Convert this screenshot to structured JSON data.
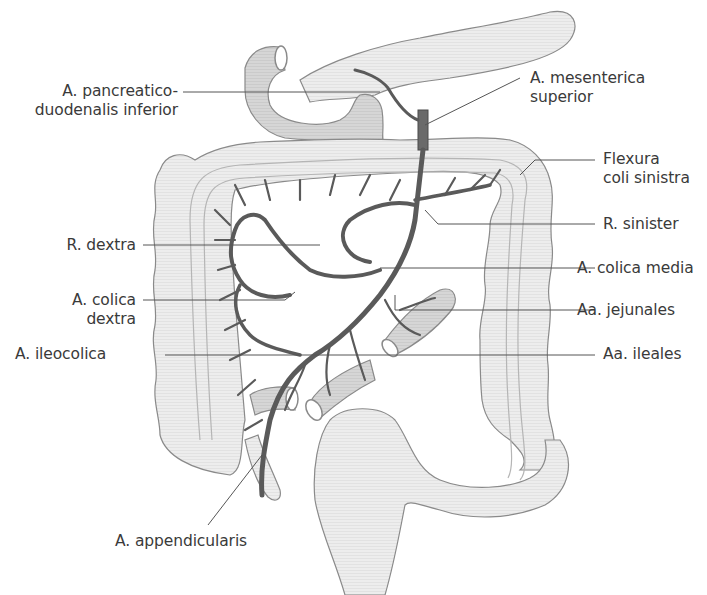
{
  "figure": {
    "colors": {
      "organ_fill": "#ececec",
      "organ_stroke": "#8a8a8a",
      "artery": "#5a5a5a",
      "small_bowel_fill": "#d4d4d4",
      "leader_line": "#555555",
      "text": "#3a3a3a"
    }
  },
  "labels": {
    "left": [
      {
        "id": "pancreaticoduodenalis",
        "lines": [
          "A. pancreatico-",
          "duodenalis inferior"
        ]
      },
      {
        "id": "r_dextra",
        "lines": [
          "R. dextra"
        ]
      },
      {
        "id": "colica_dextra",
        "lines": [
          "A. colica",
          "dextra"
        ]
      },
      {
        "id": "ileocolica",
        "lines": [
          "A. ileocolica"
        ]
      },
      {
        "id": "appendicularis",
        "lines": [
          "A. appendicularis"
        ]
      }
    ],
    "right": [
      {
        "id": "mesenterica_superior",
        "lines": [
          "A. mesenterica",
          "superior"
        ]
      },
      {
        "id": "flexura_coli_sinistra",
        "lines": [
          "Flexura",
          "coli sinistra"
        ]
      },
      {
        "id": "r_sinister",
        "lines": [
          "R. sinister"
        ]
      },
      {
        "id": "colica_media",
        "lines": [
          "A. colica media"
        ]
      },
      {
        "id": "jejunales",
        "lines": [
          "Aa. jejunales"
        ]
      },
      {
        "id": "ileales",
        "lines": [
          "Aa. ileales"
        ]
      }
    ]
  }
}
